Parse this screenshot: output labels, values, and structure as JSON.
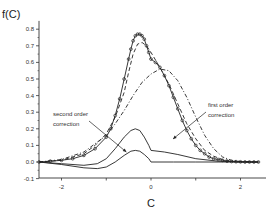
{
  "chart_data": {
    "type": "line",
    "title": "",
    "xlabel": "C",
    "ylabel": "f(C)",
    "xlim": [
      -2.5,
      2.5
    ],
    "ylim": [
      -0.1,
      0.85
    ],
    "x_ticks": [
      -2,
      0,
      2
    ],
    "x_tick_labels": [
      "-2",
      "0",
      "2"
    ],
    "y_ticks": [
      -0.1,
      0.0,
      0.1,
      0.2,
      0.3,
      0.4,
      0.5,
      0.6,
      0.7,
      0.8
    ],
    "y_tick_labels": [
      "-0.1",
      "0.0",
      "0.1",
      "0.2",
      "0.3",
      "0.4",
      "0.5",
      "0.6",
      "0.7",
      "0.8"
    ],
    "grid": false,
    "legend": null,
    "annotations": [
      {
        "text": [
          "second order",
          "correction"
        ],
        "arrow_to": [
          -0.55,
          0.06
        ]
      },
      {
        "text": [
          "first order",
          "correction"
        ],
        "arrow_to": [
          -0.05,
          0.1
        ]
      }
    ],
    "series": [
      {
        "name": "data (circles)",
        "style": "markers-open-circle",
        "x": [
          -2.5,
          -2.25,
          -2.0,
          -1.75,
          -1.5,
          -1.25,
          -1.0,
          -0.9,
          -0.8,
          -0.7,
          -0.6,
          -0.5,
          -0.45,
          -0.4,
          -0.35,
          -0.3,
          -0.25,
          -0.2,
          -0.15,
          -0.1,
          -0.05,
          0.0,
          0.1,
          0.2,
          0.3,
          0.4,
          0.5,
          0.6,
          0.7,
          0.8,
          0.9,
          1.0,
          1.1,
          1.2,
          1.3,
          1.4,
          1.5,
          1.6,
          1.7,
          1.8,
          1.9,
          2.0,
          2.1,
          2.2,
          2.3,
          2.4
        ],
        "y": [
          0.0,
          0.005,
          0.01,
          0.02,
          0.04,
          0.08,
          0.15,
          0.2,
          0.28,
          0.38,
          0.5,
          0.62,
          0.68,
          0.73,
          0.76,
          0.77,
          0.77,
          0.76,
          0.74,
          0.7,
          0.66,
          0.62,
          0.6,
          0.57,
          0.52,
          0.46,
          0.39,
          0.32,
          0.25,
          0.19,
          0.14,
          0.1,
          0.07,
          0.05,
          0.03,
          0.02,
          0.015,
          0.01,
          0.005,
          0.003,
          0.002,
          0.001,
          0.0,
          0.0,
          0.0,
          0.0
        ]
      },
      {
        "name": "full fit (solid)",
        "style": "solid",
        "x": [
          -2.5,
          -2.25,
          -2.0,
          -1.75,
          -1.5,
          -1.25,
          -1.0,
          -0.9,
          -0.8,
          -0.7,
          -0.6,
          -0.5,
          -0.45,
          -0.4,
          -0.35,
          -0.3,
          -0.25,
          -0.2,
          -0.15,
          -0.1,
          -0.05,
          0.0,
          0.1,
          0.2,
          0.3,
          0.4,
          0.5,
          0.6,
          0.7,
          0.8,
          0.9,
          1.0,
          1.1,
          1.2,
          1.3,
          1.4,
          1.5,
          1.6,
          1.7,
          1.8,
          1.9,
          2.0,
          2.2,
          2.4
        ],
        "y": [
          0.0,
          0.005,
          0.01,
          0.02,
          0.04,
          0.08,
          0.15,
          0.2,
          0.28,
          0.38,
          0.5,
          0.62,
          0.68,
          0.73,
          0.76,
          0.77,
          0.77,
          0.76,
          0.74,
          0.7,
          0.66,
          0.62,
          0.6,
          0.57,
          0.52,
          0.46,
          0.39,
          0.32,
          0.25,
          0.19,
          0.14,
          0.1,
          0.07,
          0.05,
          0.03,
          0.02,
          0.015,
          0.01,
          0.005,
          0.003,
          0.002,
          0.001,
          0.0,
          0.0
        ]
      },
      {
        "name": "zeroth + first order (dash)",
        "style": "dashed",
        "x": [
          -2.5,
          -2.0,
          -1.5,
          -1.25,
          -1.0,
          -0.8,
          -0.6,
          -0.5,
          -0.4,
          -0.3,
          -0.2,
          -0.1,
          0.0,
          0.2,
          0.4,
          0.6,
          0.8,
          1.0,
          1.2,
          1.4,
          1.6,
          1.8,
          2.0,
          2.4
        ],
        "y": [
          0.0,
          0.01,
          0.05,
          0.1,
          0.17,
          0.27,
          0.42,
          0.54,
          0.65,
          0.71,
          0.72,
          0.7,
          0.66,
          0.57,
          0.47,
          0.35,
          0.23,
          0.14,
          0.07,
          0.035,
          0.015,
          0.005,
          0.002,
          0.0
        ]
      },
      {
        "name": "zeroth order (dash-dot)",
        "style": "dash-dot",
        "x": [
          -2.5,
          -2.0,
          -1.5,
          -1.0,
          -0.8,
          -0.6,
          -0.4,
          -0.2,
          0.0,
          0.2,
          0.4,
          0.6,
          0.8,
          1.0,
          1.2,
          1.4,
          1.6,
          1.8,
          2.0,
          2.4
        ],
        "y": [
          0.0,
          0.015,
          0.06,
          0.16,
          0.23,
          0.31,
          0.4,
          0.48,
          0.53,
          0.56,
          0.55,
          0.49,
          0.39,
          0.27,
          0.16,
          0.08,
          0.03,
          0.01,
          0.003,
          0.0
        ]
      },
      {
        "name": "first order correction",
        "style": "solid",
        "x": [
          -2.5,
          -2.0,
          -1.5,
          -1.2,
          -1.0,
          -0.8,
          -0.6,
          -0.45,
          -0.35,
          -0.25,
          -0.15,
          -0.05,
          0.0,
          0.3,
          0.6,
          1.0,
          1.5,
          2.0,
          2.4
        ],
        "y": [
          0.0,
          -0.01,
          -0.02,
          -0.01,
          0.02,
          0.08,
          0.15,
          0.19,
          0.2,
          0.19,
          0.15,
          0.1,
          0.07,
          0.06,
          0.045,
          0.02,
          0.005,
          0.0,
          0.0
        ]
      },
      {
        "name": "second order correction",
        "style": "solid",
        "x": [
          -2.5,
          -2.0,
          -1.5,
          -1.2,
          -1.0,
          -0.8,
          -0.6,
          -0.45,
          -0.35,
          -0.25,
          -0.15,
          -0.05,
          0.0,
          0.5,
          1.0,
          1.5,
          2.0,
          2.4
        ],
        "y": [
          0.0,
          -0.015,
          -0.035,
          -0.04,
          -0.03,
          0.0,
          0.04,
          0.065,
          0.07,
          0.065,
          0.045,
          0.02,
          0.0,
          0.0,
          0.0,
          0.0,
          0.0,
          0.0
        ]
      }
    ]
  }
}
